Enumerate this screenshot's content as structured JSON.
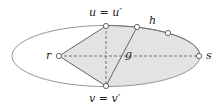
{
  "diagram": {
    "colors": {
      "outline": "#8a8a8a",
      "edge": "#555555",
      "fill": "#e3e3e3",
      "dash": "#555555",
      "node_fill": "#ffffff",
      "node_stroke": "#555555"
    },
    "labels": {
      "u": "u = u′",
      "v": "v = v′",
      "r": "r",
      "s": "s",
      "h": "h",
      "g": "g"
    },
    "nodes": [
      {
        "id": "u",
        "x": 106,
        "y": 26
      },
      {
        "id": "v",
        "x": 106,
        "y": 86
      },
      {
        "id": "r",
        "x": 59,
        "y": 56
      },
      {
        "id": "s",
        "x": 199,
        "y": 56
      },
      {
        "id": "h1",
        "x": 137,
        "y": 27
      },
      {
        "id": "h2",
        "x": 168,
        "y": 33
      }
    ],
    "edges": [
      {
        "from": "r",
        "to": "u",
        "style": "solid"
      },
      {
        "from": "r",
        "to": "v",
        "style": "solid"
      },
      {
        "from": "h1",
        "to": "v",
        "style": "solid"
      },
      {
        "from": "u",
        "to": "v",
        "style": "dashed"
      },
      {
        "from": "r",
        "to": "s",
        "style": "dashed"
      }
    ]
  }
}
